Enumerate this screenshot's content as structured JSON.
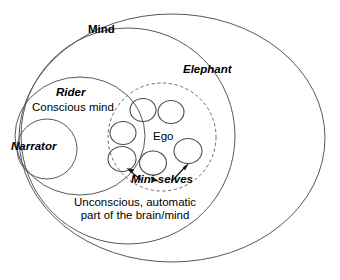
{
  "diagram": {
    "regions": [
      {
        "id": "mind",
        "label": "Mind",
        "style": "bold",
        "shape": "ellipse",
        "stroke": "solid"
      },
      {
        "id": "elephant",
        "label": "Elephant",
        "style": "bold-italic",
        "shape": "ellipse",
        "stroke": "solid"
      },
      {
        "id": "rider",
        "label": "Rider",
        "style": "bold-italic",
        "shape": "ellipse",
        "stroke": "solid"
      },
      {
        "id": "narrator",
        "label": "Narrator",
        "style": "bold-italic",
        "shape": "circle",
        "stroke": "solid"
      },
      {
        "id": "ego",
        "label": "Ego",
        "style": "regular",
        "shape": "circle",
        "stroke": "dashed"
      }
    ],
    "annotations": [
      {
        "id": "conscious-mind",
        "label": "Conscious mind",
        "style": "regular"
      },
      {
        "id": "mini-selves",
        "label": "Mini-selves",
        "style": "bold-italic"
      }
    ],
    "caption": {
      "line1": "Unconscious, automatic",
      "line2": "part of the brain/mind"
    },
    "mini_selves_count": 6,
    "arrow_count": 3,
    "colors": {
      "outline": "#58585a",
      "dashed_outline": "#6b6b6d",
      "mini_circle": "#4c4c4e",
      "arrow": "#1a1a1a",
      "text": "#000000",
      "background": "#ffffff"
    }
  }
}
